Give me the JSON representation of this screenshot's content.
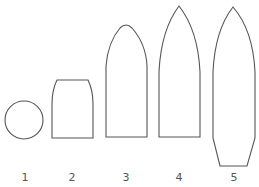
{
  "figure": {
    "stroke_color": "#555555",
    "background": "#ffffff",
    "shapes": [
      {
        "label": "1",
        "kind": "circle"
      },
      {
        "label": "2",
        "kind": "truncated-rounded-block"
      },
      {
        "label": "3",
        "kind": "rounded-ogive"
      },
      {
        "label": "4",
        "kind": "pointed-ogive"
      },
      {
        "label": "5",
        "kind": "pointed-ogive-with-boattail"
      }
    ]
  }
}
